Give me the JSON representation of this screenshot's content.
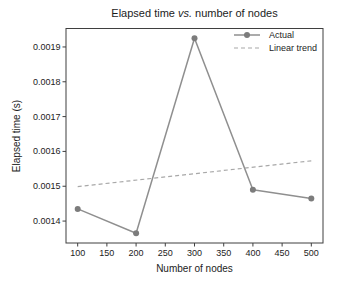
{
  "figure": {
    "background": "#ffffff"
  },
  "chart_data": {
    "type": "line",
    "title": "Elapsed time vs. number of nodes",
    "title_parts": {
      "prefix": "Elapsed time ",
      "italic": "vs.",
      "suffix": " number of nodes"
    },
    "xlabel": "Number of nodes",
    "ylabel": "Elapsed time (s)",
    "x_ticks": [
      100,
      150,
      200,
      250,
      300,
      350,
      400,
      450,
      500
    ],
    "y_ticks": [
      {
        "value": 0.0014,
        "label": "0.0014"
      },
      {
        "value": 0.0015,
        "label": "0.0015"
      },
      {
        "value": 0.0016,
        "label": "0.0016"
      },
      {
        "value": 0.0017,
        "label": "0.0017"
      },
      {
        "value": 0.0018,
        "label": "0.0018"
      },
      {
        "value": 0.0019,
        "label": "0.0019"
      }
    ],
    "xlim": [
      80,
      520
    ],
    "ylim": [
      0.001337,
      0.001953
    ],
    "grid": false,
    "legend_position": "upper right",
    "series": [
      {
        "name": "Actual",
        "style": "solid",
        "marker": "circle",
        "color": "#8f8f8f",
        "marker_color": "#7c7c7c",
        "x": [
          100,
          200,
          300,
          400,
          500
        ],
        "y": [
          0.001435,
          0.001365,
          0.001925,
          0.00149,
          0.001465
        ]
      },
      {
        "name": "Linear trend",
        "style": "dashed",
        "marker": "none",
        "color": "#a8a8a8",
        "x": [
          100,
          500
        ],
        "y": [
          0.001499,
          0.001573
        ]
      }
    ],
    "colors": {
      "spine": "#3f3f3f",
      "text": "#1c1c1c"
    }
  }
}
